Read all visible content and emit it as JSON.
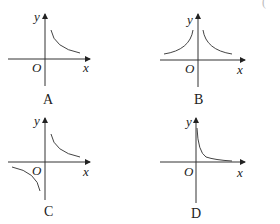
{
  "figure": {
    "right_paren": "(",
    "axis_labels": {
      "x": "x",
      "y": "y",
      "origin": "O"
    },
    "panels": [
      {
        "id": "A",
        "label": "A",
        "curve": "single branch in quadrant I, decreasing"
      },
      {
        "id": "B",
        "label": "B",
        "curve": "two branches in quadrants I and II, symmetric about y-axis"
      },
      {
        "id": "C",
        "label": "C",
        "curve": "two branches in quadrants I and III, odd symmetry"
      },
      {
        "id": "D",
        "label": "D",
        "curve": "single branch in quadrant I, steep decay hugging axes"
      }
    ]
  }
}
